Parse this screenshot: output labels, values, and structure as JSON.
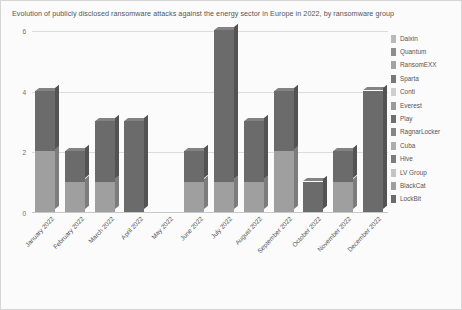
{
  "chart_data": {
    "type": "bar",
    "title": "Evolution of publicly disclosed ransomware attacks against the energy sector in Europe in 2022, by ransomware group",
    "xlabel": "",
    "ylabel": "",
    "ylim": [
      0,
      6
    ],
    "yticks": [
      0,
      2,
      4,
      6
    ],
    "grid": true,
    "stacked": true,
    "legend_position": "right",
    "categories": [
      "January 2022",
      "February 2022",
      "March 2022",
      "April 2022",
      "May 2022",
      "June 2022",
      "July 2022",
      "August 2022",
      "September 2022",
      "October 2022",
      "November 2022",
      "December 2022"
    ],
    "totals": [
      4,
      2,
      3,
      3,
      0,
      2,
      6,
      3,
      4,
      1,
      2,
      4
    ],
    "series": [
      {
        "name": "Daixin",
        "color": "#b9b9b9",
        "values": [
          0,
          0,
          0,
          0,
          0,
          0,
          0,
          0,
          0,
          0,
          0,
          0
        ]
      },
      {
        "name": "Quantum",
        "color": "#8c8c8c",
        "values": [
          0,
          0,
          0,
          0,
          0,
          0,
          0,
          0,
          0,
          0,
          0,
          0
        ]
      },
      {
        "name": "RansomEXX",
        "color": "#a3a3a3",
        "values": [
          0,
          0,
          0,
          0,
          0,
          0,
          0,
          0,
          0,
          0,
          0,
          0
        ]
      },
      {
        "name": "Sparta",
        "color": "#787878",
        "values": [
          0,
          0,
          0,
          0,
          0,
          0,
          0,
          0,
          0,
          0,
          0,
          0
        ]
      },
      {
        "name": "Conti",
        "color": "#cfcfcf",
        "values": [
          0,
          0,
          0,
          0,
          0,
          0,
          0,
          0,
          0,
          0,
          0,
          0
        ]
      },
      {
        "name": "Everest",
        "color": "#9b9b9b",
        "values": [
          0,
          0,
          0,
          0,
          0,
          0,
          0,
          0,
          0,
          0,
          0,
          0
        ]
      },
      {
        "name": "Play",
        "color": "#6f6f6f",
        "values": [
          0,
          0,
          0,
          0,
          0,
          0,
          0,
          0,
          0,
          0,
          0,
          0
        ]
      },
      {
        "name": "RagnarLocker",
        "color": "#868686",
        "values": [
          0,
          0,
          0,
          0,
          0,
          0,
          0,
          0,
          0,
          0,
          0,
          0
        ]
      },
      {
        "name": "Cuba",
        "color": "#adadad",
        "values": [
          0,
          0,
          0,
          0,
          0,
          0,
          0,
          0,
          0,
          0,
          0,
          0
        ]
      },
      {
        "name": "Hive",
        "color": "#7d7d7d",
        "values": [
          0,
          0,
          0,
          0,
          0,
          0,
          0,
          0,
          0,
          0,
          0,
          0
        ]
      },
      {
        "name": "LV Group",
        "color": "#c4c4c4",
        "values": [
          0,
          0,
          0,
          0,
          0,
          0,
          0,
          0,
          0,
          0,
          0,
          0
        ]
      },
      {
        "name": "BlackCat",
        "color": "#9f9f9f",
        "values": [
          2,
          1,
          1,
          0,
          0,
          1,
          1,
          1,
          2,
          0,
          1,
          0
        ]
      },
      {
        "name": "LockBit",
        "color": "#6b6b6b",
        "values": [
          2,
          1,
          2,
          3,
          0,
          1,
          5,
          2,
          2,
          1,
          1,
          4
        ]
      }
    ]
  },
  "legend": {
    "items": [
      {
        "label": "Daixin",
        "color": "#b9b9b9"
      },
      {
        "label": "Quantum",
        "color": "#8c8c8c"
      },
      {
        "label": "RansomEXX",
        "color": "#a3a3a3"
      },
      {
        "label": "Sparta",
        "color": "#787878"
      },
      {
        "label": "Conti",
        "color": "#cfcfcf"
      },
      {
        "label": "Everest",
        "color": "#9b9b9b"
      },
      {
        "label": "Play",
        "color": "#6f6f6f"
      },
      {
        "label": "RagnarLocker",
        "color": "#868686"
      },
      {
        "label": "Cuba",
        "color": "#adadad"
      },
      {
        "label": "Hive",
        "color": "#7d7d7d"
      },
      {
        "label": "LV Group",
        "color": "#c4c4c4"
      },
      {
        "label": "BlackCat",
        "color": "#9f9f9f"
      },
      {
        "label": "LockBit",
        "color": "#6b6b6b"
      }
    ]
  }
}
